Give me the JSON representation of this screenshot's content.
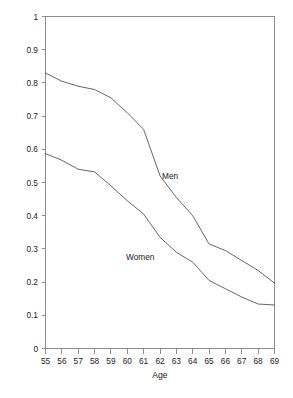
{
  "chart_data": {
    "type": "line",
    "title": "",
    "xlabel": "Age",
    "ylabel": "",
    "x": [
      55,
      56,
      57,
      58,
      59,
      60,
      61,
      62,
      63,
      64,
      65,
      66,
      67,
      68,
      69
    ],
    "categories": [
      "55",
      "56",
      "57",
      "58",
      "59",
      "60",
      "61",
      "62",
      "63",
      "64",
      "65",
      "66",
      "67",
      "68",
      "69"
    ],
    "series": [
      {
        "name": "Men",
        "label": "Men",
        "values": [
          0.83,
          0.805,
          0.79,
          0.78,
          0.755,
          0.71,
          0.66,
          0.52,
          0.455,
          0.4,
          0.315,
          0.295,
          0.265,
          0.235,
          0.197
        ],
        "color": "#4a4a4a"
      },
      {
        "name": "Women",
        "label": "Women",
        "values": [
          0.587,
          0.567,
          0.54,
          0.532,
          0.49,
          0.445,
          0.405,
          0.335,
          0.29,
          0.26,
          0.205,
          0.18,
          0.155,
          0.134,
          0.131
        ],
        "color": "#4a4a4a"
      }
    ],
    "xlim": [
      55,
      69
    ],
    "ylim": [
      0,
      1
    ],
    "yticks": [
      0,
      0.1,
      0.2,
      0.3,
      0.4,
      0.5,
      0.6,
      0.7,
      0.8,
      0.9,
      1
    ],
    "ytick_labels": [
      "0",
      "0.1",
      "0.2",
      "0.3",
      "0.4",
      "0.5",
      "0.6",
      "0.7",
      "0.8",
      "0.9",
      "1"
    ],
    "xticks": [
      55,
      56,
      57,
      58,
      59,
      60,
      61,
      62,
      63,
      64,
      65,
      66,
      67,
      68,
      69
    ],
    "xtick_labels": [
      "55",
      "56",
      "57",
      "58",
      "59",
      "60",
      "61",
      "62",
      "63",
      "64",
      "65",
      "66",
      "67",
      "68",
      "69"
    ],
    "grid": false,
    "legend_position": "inline-annotation",
    "annotations": [
      {
        "text": "Men",
        "x": 62.0,
        "y": 0.52
      },
      {
        "text": "Women",
        "x": 59.8,
        "y": 0.275
      }
    ],
    "frame_color": "#8d8d8d",
    "background": "#ffffff"
  },
  "axis": {
    "x_title": "Age",
    "men_label": "Men",
    "women_label": "Women"
  }
}
